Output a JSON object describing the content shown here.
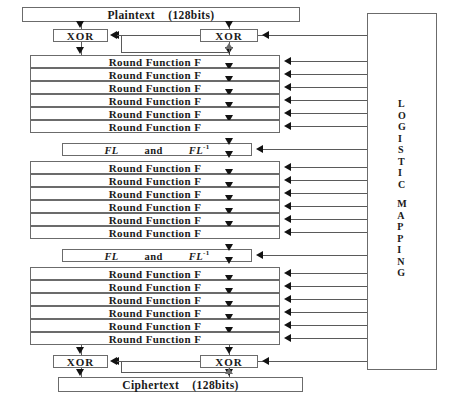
{
  "diagram": {
    "plaintext": {
      "label": "Plaintext    (128bits)",
      "x": 22,
      "y": 7,
      "width": 278
    },
    "ciphertext": {
      "label": "Ciphertext    (128bits)",
      "x": 58,
      "y": 377,
      "width": 245
    },
    "xor_label": "XOR",
    "xor_boxes": [
      {
        "name": "xor-top-left",
        "x": 53,
        "y": 29,
        "width": 55
      },
      {
        "name": "xor-top-right",
        "x": 200,
        "y": 29,
        "width": 58
      },
      {
        "name": "xor-bottom-left",
        "x": 53,
        "y": 355,
        "width": 55
      },
      {
        "name": "xor-bottom-right",
        "x": 200,
        "y": 355,
        "width": 58
      }
    ],
    "round_label": "Round Function F",
    "round_rows": [
      {
        "y": 55
      },
      {
        "y": 68
      },
      {
        "y": 81
      },
      {
        "y": 94
      },
      {
        "y": 107
      },
      {
        "y": 120
      },
      {
        "y": 161
      },
      {
        "y": 174
      },
      {
        "y": 187
      },
      {
        "y": 200
      },
      {
        "y": 213
      },
      {
        "y": 226
      },
      {
        "y": 267
      },
      {
        "y": 280
      },
      {
        "y": 293
      },
      {
        "y": 306
      },
      {
        "y": 319
      },
      {
        "y": 332
      }
    ],
    "round_box_x": 30,
    "round_box_width": 250,
    "fl_rows": [
      {
        "y": 143
      },
      {
        "y": 249
      }
    ],
    "fl_box_x": 62,
    "fl_box_width": 190,
    "fl_left_symbol": "FL",
    "fl_conjunction": "and",
    "fl_right_symbol": "FL",
    "fl_right_superscript": "-1",
    "logistic": {
      "x": 367,
      "y": 13,
      "width": 70,
      "height": 357,
      "line1": "LOGISTIC",
      "line2": "MAPPING",
      "text_top": 98
    },
    "colors": {
      "border": "#6b6b6b",
      "line": "#5a5a5a",
      "arrow": "#121212",
      "text": "#1a1a1a",
      "background": "#ffffff"
    }
  }
}
